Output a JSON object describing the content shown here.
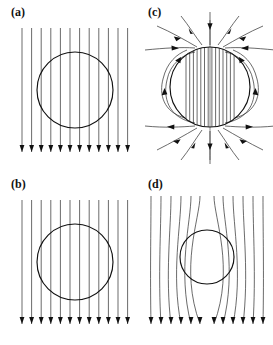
{
  "figure": {
    "background_color": "#ffffff",
    "line_color": "#2b2b2b",
    "circle_color": "#111111",
    "panel_count": 4
  },
  "panels": [
    {
      "id": "a",
      "label": "(a)",
      "description": "Uniform downward field lines passing straight through the sphere, undisturbed",
      "field_direction": "downward",
      "line_count": 12,
      "interior_lines": "uniform, same spacing as exterior",
      "circle": {
        "cx": 75,
        "cy": 90,
        "r": 38
      },
      "line_span": {
        "x_start": 22,
        "x_end": 128,
        "y_top": 28,
        "y_bottom": 158
      },
      "arrow_row_y": 150
    },
    {
      "id": "b",
      "label": "(b)",
      "description": "Uniform downward field lines passing straight through the sphere, undisturbed",
      "field_direction": "downward",
      "line_count": 12,
      "interior_lines": "uniform, same spacing as exterior",
      "circle": {
        "cx": 75,
        "cy": 90,
        "r": 38
      },
      "line_span": {
        "x_start": 22,
        "x_end": 128,
        "y_top": 28,
        "y_bottom": 158
      },
      "arrow_row_y": 150
    },
    {
      "id": "c",
      "label": "(c)",
      "description": "Magnetized sphere with dense uniform interior field and external dipole return loops with side lobes",
      "field_direction": "downward inside, looping outside",
      "interior_line_count": 14,
      "exterior_fan_count": 12,
      "side_lobe_count": 4,
      "circle": {
        "cx": 73,
        "cy": 87,
        "r": 40
      },
      "arrow_style": "arrowheads along curved exterior lines, inward at top, outward at bottom"
    },
    {
      "id": "d",
      "label": "(d)",
      "description": "Field lines excluded from the sphere, bending around it; interior is field free",
      "field_direction": "downward",
      "line_count": 12,
      "interior_lines": "none - flux excluded",
      "circle": {
        "cx": 70,
        "cy": 85,
        "r": 27
      },
      "line_span": {
        "x_start": 14,
        "x_end": 126,
        "y_top": 24,
        "y_bottom": 158
      },
      "arrow_row_y": 150
    }
  ]
}
